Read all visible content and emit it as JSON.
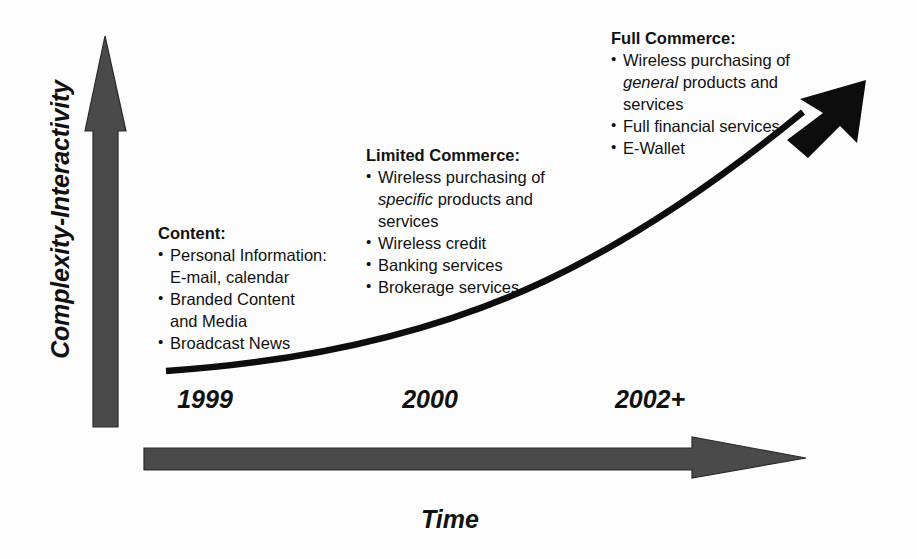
{
  "figure": {
    "background_color": "#fdfdfd",
    "text_color": "#111111",
    "arrow_axis_color": "#4a4a4a",
    "curve_color": "#0d0d0d"
  },
  "axes": {
    "y": {
      "label": "Complexity-Interactivity",
      "icon": "up-arrow-icon",
      "direction": "up"
    },
    "x": {
      "label": "Time",
      "icon": "right-arrow-icon",
      "direction": "right"
    }
  },
  "timeline": {
    "ticks": [
      {
        "label": "1999",
        "x": 205
      },
      {
        "label": "2000",
        "x": 430
      },
      {
        "label": "2002+",
        "x": 650
      }
    ]
  },
  "growth_curve": {
    "name": "growth-curve-arrow",
    "shape": "exponential",
    "description": "Curved arrow rising from lower-left to upper-right"
  },
  "stages": [
    {
      "id": "content",
      "title": "Content:",
      "items": [
        {
          "text": "Personal Information:",
          "continuation": "E-mail, calendar"
        },
        {
          "text": "Branded Content",
          "continuation": "and Media"
        },
        {
          "text": "Broadcast News",
          "continuation": ""
        }
      ]
    },
    {
      "id": "limited-commerce",
      "title": "Limited Commerce:",
      "items": [
        {
          "text_before": "Wireless purchasing of",
          "emphasis": "specific",
          "text_after": "products and",
          "continuation": "services"
        },
        {
          "text": "Wireless credit",
          "continuation": ""
        },
        {
          "text": "Banking services",
          "continuation": ""
        },
        {
          "text": "Brokerage services",
          "continuation": ""
        }
      ]
    },
    {
      "id": "full-commerce",
      "title": "Full Commerce:",
      "items": [
        {
          "text_before": "Wireless purchasing of",
          "emphasis": "general",
          "text_after": "products and",
          "continuation": "services"
        },
        {
          "text": "Full financial services",
          "continuation": ""
        },
        {
          "text": "E-Wallet",
          "continuation": ""
        }
      ]
    }
  ]
}
